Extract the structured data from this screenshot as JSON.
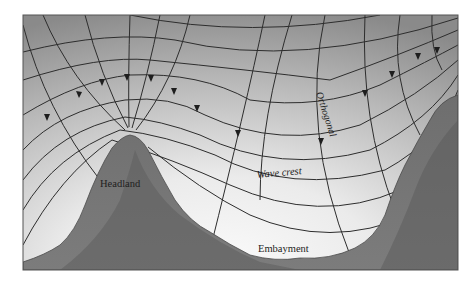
{
  "figure": {
    "labels": {
      "headland": "Headland",
      "wave_crest": "Wave crest",
      "orthogonal": "Orthogonal",
      "embayment": "Embayment"
    },
    "colors": {
      "deep_water_top": "#8c8c8c",
      "shallow_water": "#f2f2f2",
      "land_light": "#7a7a7a",
      "land_dark": "#5c5c5c",
      "line": "#2a2a2a",
      "frame": "#555555"
    },
    "elements": {
      "orthogonal_count": 11,
      "wave_crest_count": 9,
      "landforms": [
        "headland",
        "embayment",
        "right-shore"
      ]
    }
  }
}
